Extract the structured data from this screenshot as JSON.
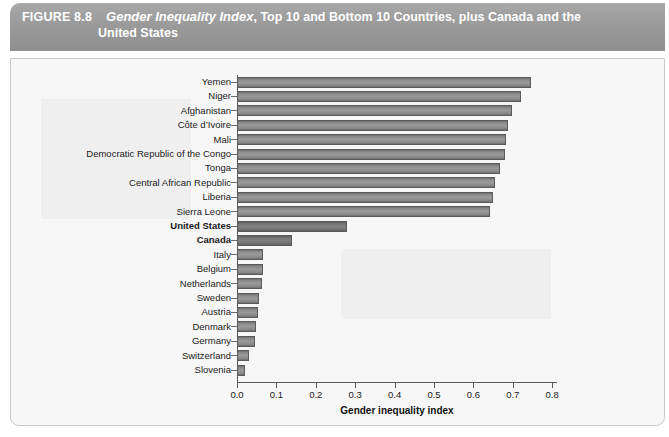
{
  "figure": {
    "number_label": "FIGURE 8.8",
    "title_italic": "Gender Inequality Index",
    "title_rest": ", Top 10 and Bottom 10 Countries, plus Canada and the",
    "title_line2": "United States"
  },
  "chart_data": {
    "type": "bar",
    "orientation": "horizontal",
    "title": "Gender Inequality Index, Top 10 and Bottom 10 Countries, plus Canada and the United States",
    "xlabel": "Gender inequality index",
    "ylabel": "",
    "xlim": [
      0.0,
      0.8
    ],
    "xticks": [
      "0.0",
      "0.1",
      "0.2",
      "0.3",
      "0.4",
      "0.5",
      "0.6",
      "0.7",
      "0.8"
    ],
    "xtick_values": [
      0.0,
      0.1,
      0.2,
      0.3,
      0.4,
      0.5,
      0.6,
      0.7,
      0.8
    ],
    "grid": false,
    "legend": null,
    "bar_color": "#8f8f8f",
    "highlight_color": "#6f6f6f",
    "categories": [
      "Yemen",
      "Niger",
      "Afghanistan",
      "Côte d’Ivoire",
      "Mali",
      "Democratic Republic of the Congo",
      "Tonga",
      "Central African Republic",
      "Liberia",
      "Sierra Leone",
      "United States",
      "Canada",
      "Italy",
      "Belgium",
      "Netherlands",
      "Sweden",
      "Austria",
      "Denmark",
      "Germany",
      "Switzerland",
      "Slovenia"
    ],
    "values": [
      0.747,
      0.721,
      0.697,
      0.689,
      0.682,
      0.681,
      0.668,
      0.654,
      0.65,
      0.643,
      0.28,
      0.14,
      0.067,
      0.065,
      0.063,
      0.055,
      0.053,
      0.048,
      0.046,
      0.03,
      0.021
    ],
    "emphasized": [
      "United States",
      "Canada"
    ]
  }
}
